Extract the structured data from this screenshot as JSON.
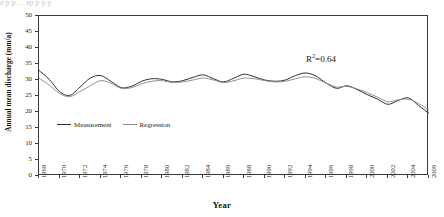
{
  "top_strip_text": "a  p  p  ...  ap  p  p  p",
  "chart_data": {
    "type": "line",
    "title": "",
    "xlabel": "Year",
    "ylabel": "Annual mean discharge (mm/a)",
    "xlim": [
      1968,
      2006
    ],
    "ylim": [
      0,
      50
    ],
    "ytick_step": 5,
    "yticks": [
      0,
      5,
      10,
      15,
      20,
      25,
      30,
      35,
      40,
      45,
      50
    ],
    "xticks": [
      1968,
      1970,
      1972,
      1974,
      1976,
      1978,
      1980,
      1982,
      1984,
      1986,
      1988,
      1990,
      1992,
      1994,
      1996,
      1998,
      2000,
      2002,
      2004,
      2006
    ],
    "x": [
      1968,
      1969,
      1970,
      1971,
      1972,
      1973,
      1974,
      1975,
      1976,
      1977,
      1978,
      1979,
      1980,
      1981,
      1982,
      1983,
      1984,
      1985,
      1986,
      1987,
      1988,
      1989,
      1990,
      1991,
      1992,
      1993,
      1994,
      1995,
      1996,
      1997,
      1998,
      1999,
      2000,
      2001,
      2002,
      2003,
      2004,
      2005,
      2006
    ],
    "grid": false,
    "legend_position": "inside-lower-left",
    "annotations": [
      {
        "text": "R²=0.64",
        "base": "R",
        "sup": "2",
        "tail": "=0.64",
        "x": 1999,
        "y": 40
      }
    ],
    "series": [
      {
        "name": "Measurement",
        "color": "#2f2f2f",
        "values": [
          33.0,
          30.2,
          26.4,
          25.2,
          27.8,
          30.6,
          31.4,
          29.6,
          27.6,
          28.0,
          29.6,
          30.4,
          30.2,
          29.4,
          29.8,
          30.8,
          31.6,
          30.4,
          29.4,
          30.6,
          31.8,
          31.0,
          30.0,
          29.6,
          30.0,
          31.4,
          32.2,
          31.2,
          29.0,
          27.4,
          28.2,
          27.0,
          25.4,
          24.0,
          22.4,
          23.6,
          24.4,
          22.0,
          19.6
        ]
      },
      {
        "name": "Regression",
        "color": "#8a8a8a",
        "values": [
          30.6,
          28.4,
          25.8,
          24.8,
          26.4,
          28.2,
          29.8,
          29.0,
          27.4,
          27.6,
          28.8,
          29.6,
          29.8,
          29.2,
          29.4,
          30.0,
          30.6,
          30.0,
          29.2,
          29.8,
          30.6,
          30.4,
          29.8,
          29.4,
          29.6,
          30.4,
          31.0,
          30.4,
          29.0,
          27.8,
          28.0,
          27.2,
          26.0,
          24.6,
          23.2,
          23.8,
          24.0,
          22.6,
          20.6
        ]
      }
    ]
  },
  "legend": {
    "items": [
      {
        "label": "Measurement",
        "color": "#2f2f2f"
      },
      {
        "label": "Regression",
        "color": "#8a8a8a"
      }
    ]
  }
}
